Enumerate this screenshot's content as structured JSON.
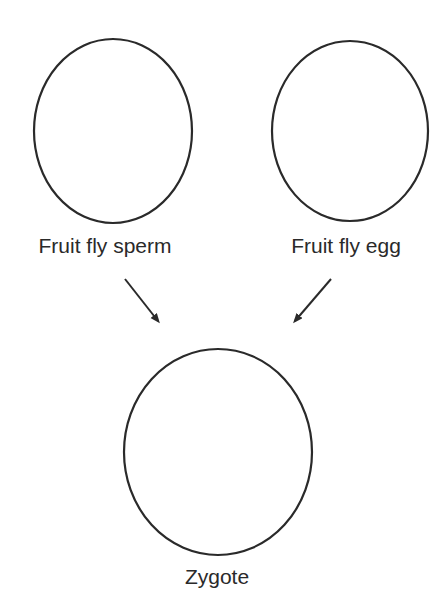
{
  "diagram": {
    "nodes": [
      {
        "id": "sperm",
        "label": "Fruit fly sperm"
      },
      {
        "id": "egg",
        "label": "Fruit fly egg"
      },
      {
        "id": "zygote",
        "label": "Zygote"
      }
    ],
    "edges": [
      {
        "from": "sperm",
        "to": "zygote"
      },
      {
        "from": "egg",
        "to": "zygote"
      }
    ],
    "colors": {
      "stroke": "#2a2a2a",
      "background": "#ffffff"
    }
  }
}
